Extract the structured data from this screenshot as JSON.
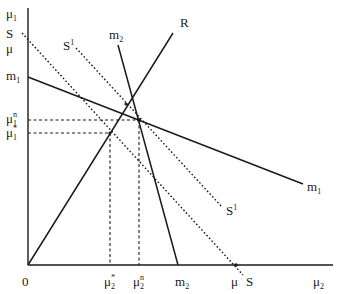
{
  "diagram": {
    "axes": {
      "y_label": "μ",
      "y_label_sub": "1",
      "x_label": "μ",
      "x_label_sub": "2",
      "origin_label": "0"
    },
    "y_ticks": [
      {
        "id": "S",
        "text": "S",
        "sub": ""
      },
      {
        "id": "mu",
        "text": "μ",
        "sub": ""
      },
      {
        "id": "m1",
        "text": "m",
        "sub": "1"
      },
      {
        "id": "mu1n",
        "text": "μ",
        "sub": "1",
        "sup": "n"
      },
      {
        "id": "mu1star",
        "text": "μ",
        "sub": "1",
        "sup": "*"
      }
    ],
    "x_ticks": [
      {
        "id": "mu2star",
        "text": "μ",
        "sub": "2",
        "sup": "*"
      },
      {
        "id": "mu2n",
        "text": "μ",
        "sub": "2",
        "sup": "n"
      },
      {
        "id": "m2",
        "text": "m",
        "sub": "2"
      },
      {
        "id": "mu",
        "text": "μ",
        "sub": ""
      },
      {
        "id": "S",
        "text": "S",
        "sub": ""
      }
    ],
    "curves": [
      {
        "id": "R",
        "label": "R",
        "style": "solid"
      },
      {
        "id": "m1",
        "label": "m",
        "label_sub": "1",
        "style": "solid"
      },
      {
        "id": "m2",
        "label": "m",
        "label_sub": "2",
        "style": "solid"
      },
      {
        "id": "S",
        "label": "S",
        "style": "dotted"
      },
      {
        "id": "S1",
        "label": "S",
        "label_sup": "1",
        "style": "dotted"
      }
    ],
    "points": [
      {
        "id": "nash",
        "label": "n"
      },
      {
        "id": "cooperative",
        "label": "*"
      },
      {
        "id": "R-m1-intersection",
        "label": ""
      }
    ]
  }
}
